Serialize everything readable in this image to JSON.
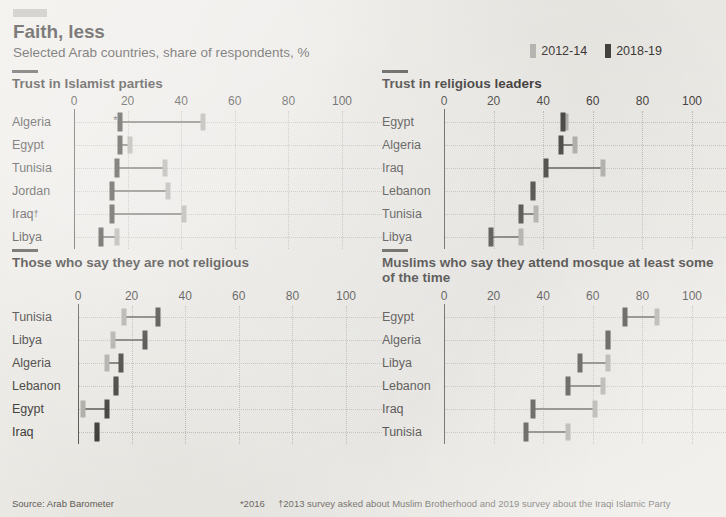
{
  "header": {
    "kicker_rule": "red-rule",
    "title": "Faith, less",
    "subtitle": "Selected Arab countries, share of respondents, %"
  },
  "legend": {
    "items": [
      {
        "label": "2012-14",
        "color": "#b2b0ab",
        "key": "old"
      },
      {
        "label": "2018-19",
        "color": "#36332f",
        "key": "new"
      }
    ]
  },
  "footer": {
    "source": "Source: Arab Barometer",
    "footnote_star": "*2016",
    "footnote_dagger": "†2013 survey asked about Muslim Brotherhood and 2019 survey about the Iraqi Islamic Party"
  },
  "axis": {
    "ticks": [
      0,
      20,
      40,
      60,
      80,
      100
    ],
    "min": 0,
    "max": 100
  },
  "chart_data": [
    {
      "type": "bar",
      "id": "trust-islamist-parties",
      "title": "Trust in Islamist parties",
      "xlabel": "",
      "ylabel": "",
      "xlim": [
        0,
        100
      ],
      "ticks": [
        0,
        20,
        40,
        60,
        80,
        100
      ],
      "grid": true,
      "legend_position": "top-right",
      "categories": [
        "Algeria",
        "Egypt",
        "Tunisia",
        "Jordan",
        "Iraq",
        "Libya"
      ],
      "category_marks": [
        "*",
        "",
        "",
        "",
        "†",
        ""
      ],
      "series": [
        {
          "name": "2012-14",
          "values": [
            48,
            21,
            34,
            35,
            41,
            16
          ]
        },
        {
          "name": "2018-19",
          "values": [
            17,
            17,
            16,
            14,
            14,
            10
          ]
        }
      ]
    },
    {
      "type": "bar",
      "id": "trust-religious-leaders",
      "title": "Trust in religious leaders",
      "xlabel": "",
      "ylabel": "",
      "xlim": [
        0,
        100
      ],
      "ticks": [
        0,
        20,
        40,
        60,
        80,
        100
      ],
      "grid": true,
      "legend_position": "top-right",
      "categories": [
        "Egypt",
        "Algeria",
        "Iraq",
        "Lebanon",
        "Tunisia",
        "Libya"
      ],
      "category_marks": [
        "",
        "",
        "",
        "",
        "",
        ""
      ],
      "series": [
        {
          "name": "2012-14",
          "values": [
            49,
            53,
            64,
            36,
            37,
            31
          ]
        },
        {
          "name": "2018-19",
          "values": [
            48,
            47,
            41,
            36,
            31,
            19
          ]
        }
      ]
    },
    {
      "type": "bar",
      "id": "not-religious",
      "title": "Those who say they are not religious",
      "xlabel": "",
      "ylabel": "",
      "xlim": [
        0,
        100
      ],
      "ticks": [
        0,
        20,
        40,
        60,
        80,
        100
      ],
      "grid": true,
      "legend_position": "top-right",
      "categories": [
        "Tunisia",
        "Libya",
        "Algeria",
        "Lebanon",
        "Egypt",
        "Iraq"
      ],
      "category_marks": [
        "",
        "",
        "",
        "",
        "",
        ""
      ],
      "series": [
        {
          "name": "2012-14",
          "values": [
            17,
            13,
            11,
            14,
            2,
            7
          ]
        },
        {
          "name": "2018-19",
          "values": [
            30,
            25,
            16,
            14,
            11,
            7
          ]
        }
      ]
    },
    {
      "type": "bar",
      "id": "attend-mosque",
      "title": "Muslims who say they attend mosque at least some of the time",
      "xlabel": "",
      "ylabel": "",
      "xlim": [
        0,
        100
      ],
      "ticks": [
        0,
        20,
        40,
        60,
        80,
        100
      ],
      "grid": true,
      "legend_position": "top-right",
      "categories": [
        "Egypt",
        "Algeria",
        "Libya",
        "Lebanon",
        "Iraq",
        "Tunisia"
      ],
      "category_marks": [
        "",
        "",
        "",
        "",
        "",
        ""
      ],
      "series": [
        {
          "name": "2012-14",
          "values": [
            86,
            66,
            66,
            64,
            61,
            50
          ]
        },
        {
          "name": "2018-19",
          "values": [
            73,
            66,
            55,
            50,
            36,
            33
          ]
        }
      ]
    }
  ],
  "colors": {
    "background": "#eceae5",
    "old_series": "#a9a6a1",
    "new_series": "#2e2b27",
    "connector": "#6e6a65",
    "axis": "#4a4741",
    "grid": "#bdbab5",
    "text": "#231f20"
  }
}
